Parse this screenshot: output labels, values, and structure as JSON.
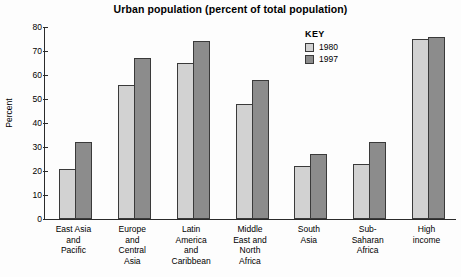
{
  "chart_data": {
    "type": "bar",
    "title": "Urban population (percent of total population)",
    "xlabel": "",
    "ylabel": "Percent",
    "ylim": [
      0,
      80
    ],
    "yticks": [
      0,
      10,
      20,
      30,
      40,
      50,
      60,
      70,
      80
    ],
    "grid": false,
    "legend_position": "inside-top-right",
    "legend_title": "KEY",
    "categories": [
      "East Asia\nand\nPacific",
      "Europe\nand\nCentral\nAsia",
      "Latin\nAmerica\nand\nCaribbean",
      "Middle\nEast and\nNorth\nAfrica",
      "South\nAsia",
      "Sub-\nSaharan\nAfrica",
      "High\nincome"
    ],
    "series": [
      {
        "name": "1980",
        "color": "#d2d2d2",
        "values": [
          21,
          56,
          65,
          48,
          22,
          23,
          75
        ]
      },
      {
        "name": "1997",
        "color": "#8c8c8c",
        "values": [
          32,
          67,
          74,
          58,
          27,
          32,
          76
        ]
      }
    ]
  },
  "colors": {
    "series_1980": "#d2d2d2",
    "series_1997": "#8c8c8c",
    "axis": "#2b2b2b",
    "bar_outline": "#3a3a3a",
    "background": "#fdfdfd"
  }
}
